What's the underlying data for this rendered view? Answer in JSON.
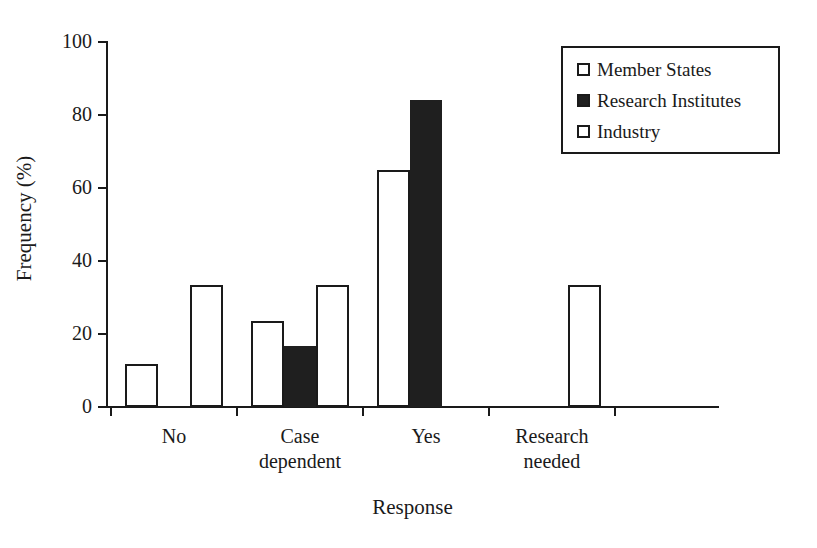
{
  "chart_data": {
    "type": "bar",
    "title": "",
    "xlabel": "Response",
    "ylabel": "Frequency (%)",
    "categories": [
      "No",
      "Case dependent",
      "Yes",
      "Research needed"
    ],
    "category_lines": [
      [
        "No"
      ],
      [
        "Case",
        "dependent"
      ],
      [
        "Yes"
      ],
      [
        "Research",
        "needed"
      ]
    ],
    "series": [
      {
        "name": "Member States",
        "fill": "open",
        "color": "#ffffff",
        "values": [
          11.8,
          23.6,
          65.0,
          0
        ]
      },
      {
        "name": "Research Institutes",
        "fill": "filled",
        "color": "#1f1f1f",
        "values": [
          0,
          16.7,
          84.0,
          0
        ]
      },
      {
        "name": "Industry",
        "fill": "open",
        "color": "#ffffff",
        "values": [
          33.4,
          33.4,
          0,
          33.4
        ]
      }
    ],
    "ylim": [
      0,
      100
    ],
    "yticks": [
      0,
      20,
      40,
      60,
      80,
      100
    ],
    "ytick_labels": [
      "0",
      "20",
      "40",
      "60",
      "80",
      "100"
    ],
    "grid": false,
    "legend_position": "top-right",
    "axis_color": "#1a1a1a"
  },
  "legend": {
    "items": [
      {
        "label": "Member States",
        "fill": "open"
      },
      {
        "label": "Research Institutes",
        "fill": "filled"
      },
      {
        "label": "Industry",
        "fill": "open"
      }
    ]
  }
}
